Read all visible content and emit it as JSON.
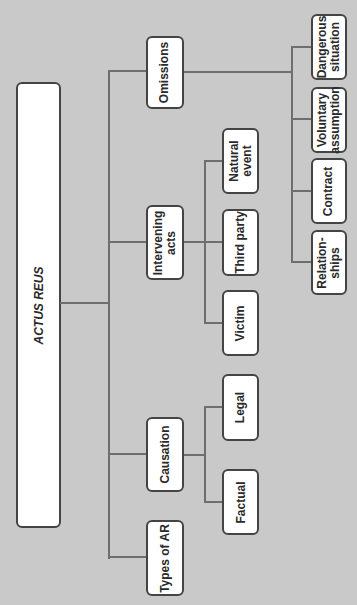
{
  "diagram": {
    "title": "ACTUS REUS",
    "colors": {
      "background": "#c9c9c9",
      "box_fill": "#ffffff",
      "box_border": "#444444",
      "connector": "#6e6e6e"
    },
    "root": {
      "label": "ACTUS REUS"
    },
    "branches": [
      {
        "label": "Omissions",
        "children": [
          {
            "label": "Dangerous\nsituation"
          },
          {
            "label": "Voluntary\nassumption"
          },
          {
            "label": "Contract"
          },
          {
            "label": "Relation-\nships"
          }
        ]
      },
      {
        "label": "Intervening\nacts",
        "children": [
          {
            "label": "Natural\nevent"
          },
          {
            "label": "Third party"
          },
          {
            "label": "Victim"
          }
        ]
      },
      {
        "label": "Causation",
        "children": [
          {
            "label": "Legal"
          },
          {
            "label": "Factual"
          }
        ]
      },
      {
        "label": "Types of AR",
        "children": []
      }
    ]
  }
}
